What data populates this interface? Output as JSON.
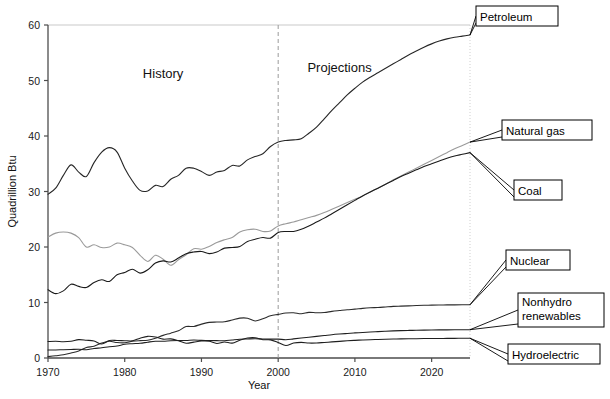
{
  "chart_data": {
    "type": "line",
    "title": "",
    "xlabel": "Year",
    "ylabel": "Quadrillion Btu",
    "xlim": [
      1970,
      2025
    ],
    "ylim": [
      0,
      60
    ],
    "xticks": [
      1970,
      1980,
      1990,
      2000,
      2010,
      2020
    ],
    "yticks": [
      0,
      10,
      20,
      30,
      40,
      50,
      60
    ],
    "grid": false,
    "legend_position": "right-callouts",
    "annotations": [
      {
        "text": "History",
        "x": 1985,
        "y": 50.5
      },
      {
        "text": "Projections",
        "x": 2008,
        "y": 51.5
      },
      {
        "text": "divider",
        "x": 2000,
        "style": "dashed-vertical"
      }
    ],
    "history_end_year": 2000,
    "x": [
      1970,
      1971,
      1972,
      1973,
      1974,
      1975,
      1976,
      1977,
      1978,
      1979,
      1980,
      1981,
      1982,
      1983,
      1984,
      1985,
      1986,
      1987,
      1988,
      1989,
      1990,
      1991,
      1992,
      1993,
      1994,
      1995,
      1996,
      1997,
      1998,
      1999,
      2000,
      2001,
      2002,
      2003,
      2004,
      2005,
      2006,
      2007,
      2008,
      2009,
      2010,
      2011,
      2012,
      2013,
      2014,
      2015,
      2016,
      2017,
      2018,
      2019,
      2020,
      2021,
      2022,
      2023,
      2024,
      2025
    ],
    "series": [
      {
        "name": "Petroleum",
        "color": "#262626",
        "values": [
          29.5,
          30.6,
          32.9,
          34.8,
          33.5,
          32.7,
          35.2,
          37.1,
          37.9,
          37.1,
          34.2,
          31.9,
          30.2,
          30.1,
          31.1,
          30.9,
          32.2,
          32.9,
          34.2,
          34.2,
          33.6,
          32.9,
          33.5,
          33.8,
          34.7,
          34.6,
          35.7,
          36.3,
          36.8,
          38.1,
          38.9,
          39.2,
          39.3,
          39.5,
          40.5,
          41.6,
          43.1,
          44.6,
          46.0,
          47.4,
          48.6,
          49.7,
          50.6,
          51.4,
          52.2,
          53.0,
          53.8,
          54.6,
          55.3,
          56.0,
          56.6,
          57.1,
          57.5,
          57.8,
          58.0,
          58.2
        ]
      },
      {
        "name": "Natural gas",
        "color": "#9a9a9a",
        "values": [
          21.8,
          22.5,
          22.7,
          22.5,
          21.7,
          20.0,
          20.4,
          19.9,
          20.0,
          20.7,
          20.4,
          19.9,
          18.5,
          17.4,
          18.5,
          17.8,
          16.7,
          17.7,
          18.6,
          19.7,
          19.6,
          20.1,
          20.8,
          21.3,
          21.7,
          22.7,
          23.1,
          23.2,
          22.8,
          22.9,
          23.8,
          24.2,
          24.5,
          24.9,
          25.3,
          25.7,
          26.2,
          26.8,
          27.4,
          28.0,
          28.6,
          29.2,
          29.9,
          30.6,
          31.3,
          32.1,
          32.8,
          33.5,
          34.2,
          34.9,
          35.6,
          36.3,
          37.0,
          37.7,
          38.3,
          38.9
        ]
      },
      {
        "name": "Coal",
        "color": "#1a1a1a",
        "values": [
          12.3,
          11.6,
          12.1,
          13.3,
          12.9,
          12.7,
          13.6,
          14.1,
          13.8,
          15.0,
          15.4,
          16.0,
          15.3,
          15.9,
          17.1,
          17.5,
          17.3,
          18.0,
          18.8,
          19.1,
          19.2,
          18.8,
          19.1,
          19.8,
          19.9,
          20.1,
          21.0,
          21.4,
          21.7,
          21.6,
          22.6,
          22.8,
          22.8,
          23.2,
          23.8,
          24.5,
          25.2,
          26.0,
          26.8,
          27.6,
          28.4,
          29.2,
          29.9,
          30.6,
          31.3,
          32.0,
          32.7,
          33.3,
          33.9,
          34.5,
          35.0,
          35.5,
          36.0,
          36.4,
          36.7,
          37.0
        ]
      },
      {
        "name": "Nuclear",
        "color": "#2b2b2b",
        "values": [
          0.24,
          0.41,
          0.58,
          0.91,
          1.27,
          1.9,
          2.11,
          2.7,
          3.02,
          2.78,
          2.74,
          3.01,
          3.13,
          3.2,
          3.55,
          4.08,
          4.47,
          4.91,
          5.66,
          5.68,
          6.1,
          6.42,
          6.48,
          6.52,
          6.84,
          7.18,
          7.17,
          6.68,
          7.07,
          7.61,
          7.86,
          8.1,
          8.15,
          7.96,
          8.22,
          8.16,
          8.21,
          8.4,
          8.55,
          8.7,
          8.8,
          8.95,
          9.05,
          9.1,
          9.2,
          9.3,
          9.35,
          9.4,
          9.45,
          9.5,
          9.52,
          9.55,
          9.57,
          9.58,
          9.59,
          9.6
        ]
      },
      {
        "name": "Nonhydro renewables",
        "color": "#1f1f1f",
        "values": [
          1.45,
          1.45,
          1.5,
          1.53,
          1.57,
          1.5,
          1.71,
          1.84,
          2.04,
          2.15,
          2.48,
          2.58,
          2.66,
          2.85,
          3.01,
          3.02,
          3.1,
          3.14,
          3.15,
          3.25,
          3.17,
          3.16,
          3.13,
          3.11,
          3.25,
          3.38,
          3.43,
          3.47,
          3.42,
          3.4,
          3.4,
          3.3,
          3.45,
          3.6,
          3.75,
          3.9,
          4.05,
          4.2,
          4.32,
          4.42,
          4.52,
          4.6,
          4.68,
          4.75,
          4.82,
          4.88,
          4.93,
          4.97,
          5.0,
          5.02,
          5.04,
          5.06,
          5.07,
          5.08,
          5.09,
          5.1
        ]
      },
      {
        "name": "Hydroelectric",
        "color": "#1f1f1f",
        "values": [
          2.96,
          3.01,
          2.93,
          3.01,
          3.31,
          3.21,
          3.07,
          2.52,
          3.14,
          3.15,
          3.12,
          3.1,
          3.57,
          3.9,
          3.77,
          3.4,
          3.44,
          3.12,
          2.66,
          2.86,
          3.05,
          3.02,
          2.62,
          2.89,
          2.68,
          3.21,
          3.59,
          3.64,
          3.3,
          3.27,
          2.81,
          2.24,
          2.69,
          2.82,
          2.69,
          2.7,
          2.8,
          2.9,
          3.0,
          3.1,
          3.18,
          3.24,
          3.3,
          3.34,
          3.38,
          3.41,
          3.44,
          3.46,
          3.48,
          3.5,
          3.51,
          3.52,
          3.53,
          3.54,
          3.55,
          3.56
        ]
      }
    ]
  },
  "callouts": [
    {
      "label": "Petroleum",
      "box_x": 476,
      "box_y": 6,
      "box_w": 82,
      "box_h": 20
    },
    {
      "label": "Natural gas",
      "box_x": 502,
      "box_y": 120,
      "box_w": 90,
      "box_h": 20
    },
    {
      "label": "Coal",
      "box_x": 514,
      "box_y": 180,
      "box_w": 48,
      "box_h": 20
    },
    {
      "label": "Nuclear",
      "box_x": 506,
      "box_y": 250,
      "box_w": 64,
      "box_h": 20
    },
    {
      "label": "Nonhydro renewables",
      "box_x": 518,
      "box_y": 293,
      "box_w": 86,
      "box_h": 34
    },
    {
      "label": "Hydroelectric",
      "box_x": 508,
      "box_y": 344,
      "box_w": 92,
      "box_h": 20
    }
  ]
}
